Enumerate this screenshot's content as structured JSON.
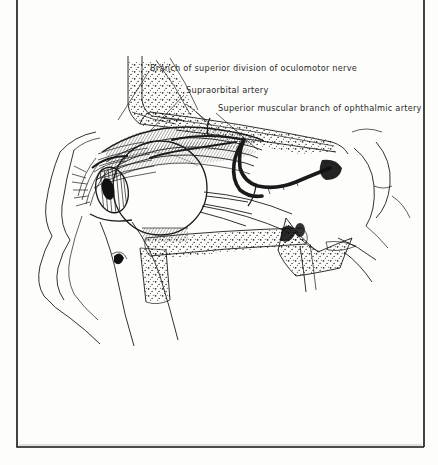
{
  "figure": {
    "kind": "anatomical-line-illustration",
    "region": "orbit, sagittal view",
    "background_color": "#fdfdfb",
    "ink_color": "#1a1a1a"
  },
  "labels": [
    {
      "id": "oculomotor-branch",
      "text": "Branch of superior division of oculomotor nerve",
      "x": 150,
      "y": 71,
      "leader": "M148,73 L118,120"
    },
    {
      "id": "supraorbital-artery",
      "text": "Supraorbital artery",
      "x": 186,
      "y": 93,
      "leader": "M184,95 L150,131"
    },
    {
      "id": "superior-muscular-branch",
      "text": "Superior muscular branch of ophthalmic artery",
      "x": 218,
      "y": 111,
      "leader": "M216,113 L258,150"
    }
  ],
  "frame": {
    "left": 17,
    "right": 424,
    "bottom": 447,
    "top": 0
  }
}
